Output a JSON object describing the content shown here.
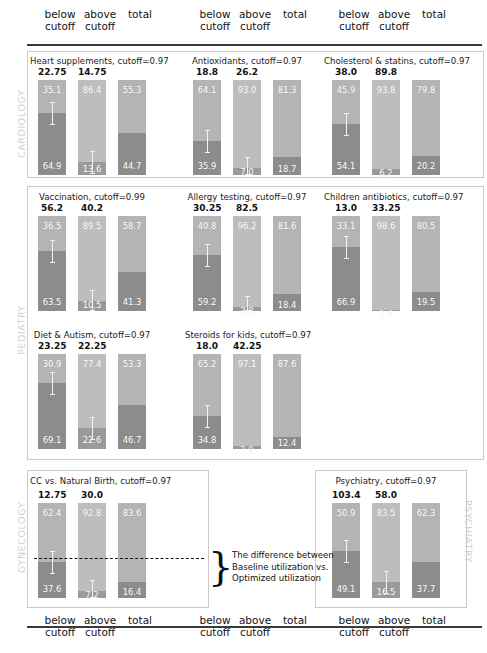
{
  "column_headers": [
    "below\ncutoff",
    "above\ncutoff",
    "total"
  ],
  "sections": [
    {
      "name": "CARDIOLOGY",
      "orientation": "up"
    },
    {
      "name": "PEDIATRY",
      "orientation": "up"
    },
    {
      "name": "GYNECOLOGY",
      "orientation": "up"
    },
    {
      "name": "PSYCHIATRY",
      "orientation": "down"
    }
  ],
  "annotation": {
    "text": "The difference between\nBaseline utilization  vs.\nOptimized utilization",
    "brace": "}"
  },
  "chart_data": {
    "type": "bar",
    "title": "",
    "subtype": "stacked-100-percent",
    "series": [
      {
        "name": "Optimized utilization (upper / light)",
        "color": "#b4b4b4"
      },
      {
        "name": "Baseline utilization (lower / dark)",
        "color": "#8c8c8c"
      }
    ],
    "categories": [
      "below cutoff",
      "above cutoff",
      "total"
    ],
    "ylim": [
      0,
      100
    ],
    "ylabel": "",
    "xlabel": "",
    "grid": false,
    "legend": "none",
    "panels": [
      {
        "section": "CARDIOLOGY",
        "title": "Heart supplements, cutoff=0.97",
        "cutoff": 0.97,
        "bars": [
          {
            "category": "below cutoff",
            "top_label": "22.75",
            "upper": 35.1,
            "lower": 64.9,
            "error_bar": true
          },
          {
            "category": "above cutoff",
            "top_label": "14.75",
            "upper": 86.4,
            "lower": 13.6,
            "error_bar": true
          },
          {
            "category": "total",
            "top_label": "",
            "upper": 55.3,
            "lower": 44.7,
            "error_bar": false
          }
        ]
      },
      {
        "section": "CARDIOLOGY",
        "title": "Antioxidants, cutoff=0.97",
        "cutoff": 0.97,
        "bars": [
          {
            "category": "below cutoff",
            "top_label": "18.8",
            "upper": 64.1,
            "lower": 35.9,
            "error_bar": true
          },
          {
            "category": "above cutoff",
            "top_label": "26.2",
            "upper": 93.0,
            "lower": 7.0,
            "error_bar": true
          },
          {
            "category": "total",
            "top_label": "",
            "upper": 81.3,
            "lower": 18.7,
            "error_bar": false
          }
        ]
      },
      {
        "section": "CARDIOLOGY",
        "title": "Cholesterol & statins, cutoff=0.97",
        "cutoff": 0.97,
        "bars": [
          {
            "category": "below cutoff",
            "top_label": "38.0",
            "upper": 45.9,
            "lower": 54.1,
            "error_bar": true
          },
          {
            "category": "above cutoff",
            "top_label": "89.8",
            "upper": 93.8,
            "lower": 6.2,
            "error_bar": false
          },
          {
            "category": "total",
            "top_label": "",
            "upper": 79.8,
            "lower": 20.2,
            "error_bar": false
          }
        ]
      },
      {
        "section": "PEDIATRY",
        "title": "Vaccination, cutoff=0.99",
        "cutoff": 0.99,
        "bars": [
          {
            "category": "below cutoff",
            "top_label": "56.2",
            "upper": 36.5,
            "lower": 63.5,
            "error_bar": true
          },
          {
            "category": "above cutoff",
            "top_label": "40.2",
            "upper": 89.5,
            "lower": 10.5,
            "error_bar": true
          },
          {
            "category": "total",
            "top_label": "",
            "upper": 58.7,
            "lower": 41.3,
            "error_bar": false
          }
        ]
      },
      {
        "section": "PEDIATRY",
        "title": "Allergy testing, cutoff=0.97",
        "cutoff": 0.97,
        "bars": [
          {
            "category": "below cutoff",
            "top_label": "30.25",
            "upper": 40.8,
            "lower": 59.2,
            "error_bar": true
          },
          {
            "category": "above cutoff",
            "top_label": "82.5",
            "upper": 96.2,
            "lower": 3.8,
            "error_bar": true
          },
          {
            "category": "total",
            "top_label": "",
            "upper": 81.6,
            "lower": 18.4,
            "error_bar": false
          }
        ]
      },
      {
        "section": "PEDIATRY",
        "title": "Children antibiotics, cutoff=0.97",
        "cutoff": 0.97,
        "bars": [
          {
            "category": "below cutoff",
            "top_label": "13.0",
            "upper": 33.1,
            "lower": 66.9,
            "error_bar": true
          },
          {
            "category": "above cutoff",
            "top_label": "33.25",
            "upper": 98.6,
            "lower": 1.4,
            "error_bar": false
          },
          {
            "category": "total",
            "top_label": "",
            "upper": 80.5,
            "lower": 19.5,
            "error_bar": false
          }
        ]
      },
      {
        "section": "PEDIATRY",
        "title": "Diet & Autism, cutoff=0.97",
        "cutoff": 0.97,
        "bars": [
          {
            "category": "below cutoff",
            "top_label": "23.25",
            "upper": 30.9,
            "lower": 69.1,
            "error_bar": true
          },
          {
            "category": "above cutoff",
            "top_label": "22.25",
            "upper": 77.4,
            "lower": 22.6,
            "error_bar": true
          },
          {
            "category": "total",
            "top_label": "",
            "upper": 53.3,
            "lower": 46.7,
            "error_bar": false
          }
        ]
      },
      {
        "section": "PEDIATRY",
        "title": "Steroids for kids, cutoff=0.97",
        "cutoff": 0.97,
        "bars": [
          {
            "category": "below cutoff",
            "top_label": "18.0",
            "upper": 65.2,
            "lower": 34.8,
            "error_bar": true
          },
          {
            "category": "above cutoff",
            "top_label": "42.25",
            "upper": 97.1,
            "lower": 2.9,
            "error_bar": false
          },
          {
            "category": "total",
            "top_label": "",
            "upper": 87.6,
            "lower": 12.4,
            "error_bar": false
          }
        ]
      },
      {
        "section": "GYNECOLOGY",
        "title": "CC vs. Natural Birth, cutoff=0.97",
        "cutoff": 0.97,
        "bars": [
          {
            "category": "below cutoff",
            "top_label": "12.75",
            "upper": 62.4,
            "lower": 37.6,
            "error_bar": true
          },
          {
            "category": "above cutoff",
            "top_label": "30.0",
            "upper": 92.8,
            "lower": 7.2,
            "error_bar": true
          },
          {
            "category": "total",
            "top_label": "",
            "upper": 83.6,
            "lower": 16.4,
            "error_bar": false
          }
        ]
      },
      {
        "section": "PSYCHIATRY",
        "title": "Psychiatry, cutoff=0.97",
        "cutoff": 0.97,
        "bars": [
          {
            "category": "below cutoff",
            "top_label": "103.4",
            "upper": 50.9,
            "lower": 49.1,
            "error_bar": true
          },
          {
            "category": "above cutoff",
            "top_label": "58.0",
            "upper": 83.5,
            "lower": 16.5,
            "error_bar": true
          },
          {
            "category": "total",
            "top_label": "",
            "upper": 62.3,
            "lower": 37.7,
            "error_bar": false
          }
        ]
      }
    ]
  }
}
